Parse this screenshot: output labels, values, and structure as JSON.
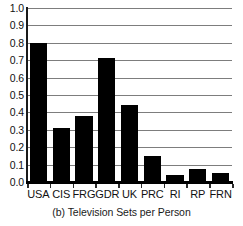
{
  "chart_data": {
    "type": "bar",
    "title": "",
    "caption": "(b) Television Sets per Person",
    "xlabel": "",
    "ylabel": "",
    "categories": [
      "USA",
      "CIS",
      "FRG",
      "GDR",
      "UK",
      "PRC",
      "RI",
      "RP",
      "FRN"
    ],
    "values": [
      0.8,
      0.31,
      0.38,
      0.71,
      0.44,
      0.15,
      0.04,
      0.075,
      0.05
    ],
    "ylim": [
      0.0,
      1.0
    ],
    "ytick_labels": [
      "1.0",
      "0.9",
      "0.8",
      "0.7",
      "0.6",
      "0.5",
      "0.4",
      "0.3",
      "0.2",
      "0.1",
      "0.0"
    ],
    "ytick_values": [
      1.0,
      0.9,
      0.8,
      0.7,
      0.6,
      0.5,
      0.4,
      0.3,
      0.2,
      0.1,
      0.0
    ],
    "grid": true,
    "grid_orientation": "horizontal",
    "legend": null,
    "legend_position": "none",
    "bar_color": "#000000",
    "grid_color": "#7d7d7d",
    "axis_color": "#000000",
    "background_color": "#ffffff"
  }
}
